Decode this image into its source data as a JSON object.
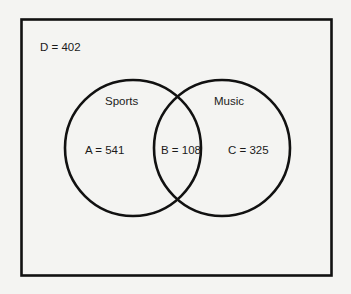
{
  "diagram": {
    "type": "venn",
    "universe": {
      "label": "D = 402",
      "name": "D",
      "value": 402
    },
    "sets": [
      {
        "name": "Sports",
        "label": "Sports"
      },
      {
        "name": "Music",
        "label": "Music"
      }
    ],
    "regions": [
      {
        "id": "A",
        "label": "A = 541",
        "value": 541,
        "description": "Sports only"
      },
      {
        "id": "B",
        "label": "B = 108",
        "value": 108,
        "description": "Sports and Music"
      },
      {
        "id": "C",
        "label": "C = 325",
        "value": 325,
        "description": "Music only"
      }
    ],
    "colors": {
      "stroke": "#111111",
      "background": "#f4f4f2",
      "text": "#1a1a1a"
    }
  }
}
